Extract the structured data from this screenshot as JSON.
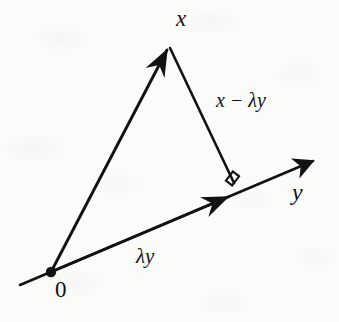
{
  "figure": {
    "kind": "vector-projection-diagram",
    "background_color": "#fbfbfa",
    "ink_color": "#121212",
    "labels": {
      "x": "x",
      "y": "y",
      "origin": "0",
      "projection": "λy",
      "residual": "x − λy"
    },
    "geometry": {
      "origin_point": [
        51,
        272
      ],
      "x_tip": [
        169,
        43
      ],
      "foot_point": [
        234,
        183
      ],
      "y_axis_start": [
        20,
        285
      ],
      "y_axis_tip": [
        320,
        158
      ],
      "right_angle_marker": [
        231,
        179
      ]
    }
  }
}
